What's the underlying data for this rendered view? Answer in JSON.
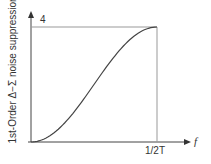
{
  "chart_data": {
    "type": "line",
    "title": "",
    "xlabel": "f",
    "ylabel": "1st-Order Δ−Σ noise suppression",
    "x_ticks": [
      "1/2T"
    ],
    "y_ticks": [
      "4"
    ],
    "xlim": [
      0,
      "1/2T"
    ],
    "ylim": [
      0,
      4
    ],
    "grid": false,
    "legend": null,
    "series": [
      {
        "name": "noise suppression",
        "x": [
          0,
          0.1,
          0.2,
          0.3,
          0.4,
          0.5,
          0.6,
          0.7,
          0.8,
          0.9,
          1.0
        ],
        "values": [
          0,
          0.1,
          0.38,
          0.82,
          1.38,
          2.0,
          2.62,
          3.18,
          3.62,
          3.9,
          4.0
        ]
      }
    ],
    "annotations": [
      "reference lines at y=4 and x=1/2T"
    ]
  },
  "labels": {
    "ylabel": "1st-Order Δ−Σ noise suppression",
    "ytick": "4",
    "xtick": "1/2T",
    "xlabel": "f"
  }
}
